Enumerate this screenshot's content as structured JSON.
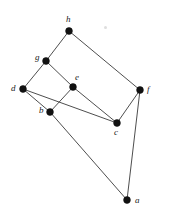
{
  "figure": {
    "name": "undirected-graph-diagram",
    "background_color": "#ffffff",
    "edge_color": "#3a3a3a",
    "vertex_color": "#111111",
    "label_color": "#1a1a1a",
    "width": 169,
    "height": 217
  },
  "graph_data": {
    "type": "graph",
    "directed": false,
    "vertex_count": 8,
    "edge_count": 11,
    "vertices": [
      {
        "id": "a",
        "label": "a",
        "x": 127,
        "y": 200,
        "label_x": 135,
        "label_y": 196
      },
      {
        "id": "b",
        "label": "b",
        "x": 50,
        "y": 112,
        "label_x": 39,
        "label_y": 106
      },
      {
        "id": "c",
        "label": "c",
        "x": 117,
        "y": 123,
        "label_x": 114,
        "label_y": 128
      },
      {
        "id": "d",
        "label": "d",
        "x": 23,
        "y": 89,
        "label_x": 11,
        "label_y": 84
      },
      {
        "id": "e",
        "label": "e",
        "x": 73,
        "y": 87,
        "label_x": 75,
        "label_y": 73
      },
      {
        "id": "f",
        "label": "f",
        "x": 140,
        "y": 90,
        "label_x": 147,
        "label_y": 85
      },
      {
        "id": "g",
        "label": "g",
        "x": 46,
        "y": 61,
        "label_x": 35,
        "label_y": 53
      },
      {
        "id": "h",
        "label": "h",
        "x": 69,
        "y": 31,
        "label_x": 66,
        "label_y": 15
      }
    ],
    "edges": [
      {
        "from": "h",
        "to": "g"
      },
      {
        "from": "h",
        "to": "f"
      },
      {
        "from": "g",
        "to": "d"
      },
      {
        "from": "g",
        "to": "e"
      },
      {
        "from": "d",
        "to": "b"
      },
      {
        "from": "d",
        "to": "c"
      },
      {
        "from": "e",
        "to": "b"
      },
      {
        "from": "e",
        "to": "c"
      },
      {
        "from": "c",
        "to": "f"
      },
      {
        "from": "f",
        "to": "a"
      },
      {
        "from": "b",
        "to": "a"
      }
    ],
    "vertex_radius": 3.4,
    "artifacts": [
      {
        "name": "paper-speck",
        "x": 104,
        "y": 26
      }
    ]
  }
}
